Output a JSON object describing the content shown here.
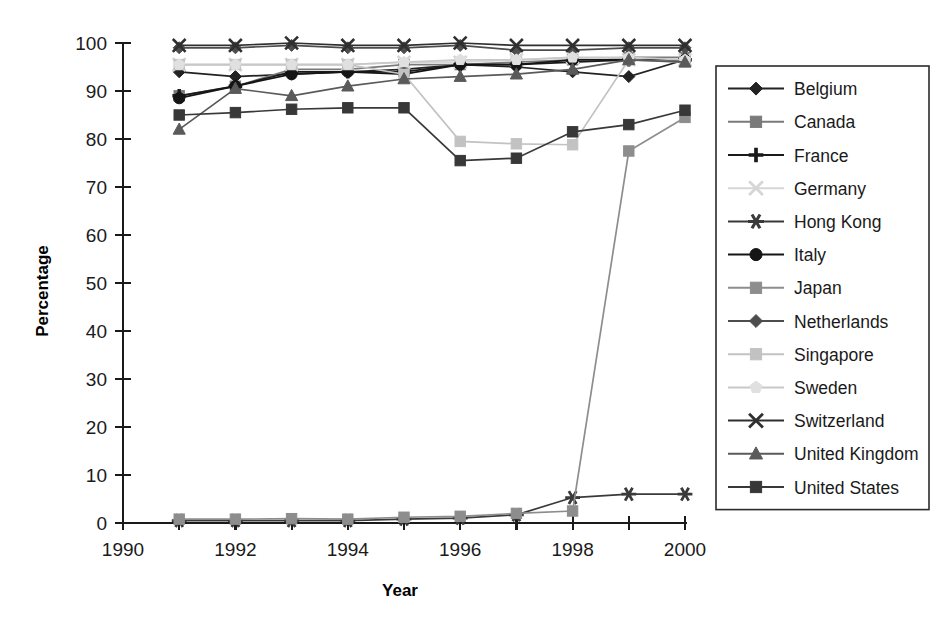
{
  "chart_data": {
    "type": "line",
    "title": "",
    "xlabel": "Year",
    "ylabel": "Percentage",
    "xlim": [
      1990,
      2000
    ],
    "ylim": [
      0,
      100
    ],
    "xticks": [
      1990,
      1991,
      1992,
      1993,
      1994,
      1995,
      1996,
      1997,
      1998,
      1999,
      2000
    ],
    "xtick_labels": [
      "1990",
      "",
      "1992",
      "",
      "1994",
      "",
      "1996",
      "",
      "1998",
      "",
      "2000"
    ],
    "yticks": [
      0,
      10,
      20,
      30,
      40,
      50,
      60,
      70,
      80,
      90,
      100
    ],
    "ytick_labels": [
      "0",
      "10",
      "20",
      "30",
      "40",
      "50",
      "60",
      "70",
      "80",
      "90",
      "100"
    ],
    "grid": false,
    "legend_position": "right",
    "x": [
      1991,
      1992,
      1993,
      1994,
      1995,
      1996,
      1997,
      1998,
      1999,
      2000
    ],
    "series": [
      {
        "name": "Belgium",
        "marker": "diamond",
        "color": "#222222",
        "line_color": "#222222",
        "values": [
          94.0,
          93.0,
          93.5,
          94.0,
          94.5,
          95.5,
          95.0,
          94.0,
          93.0,
          96.5
        ]
      },
      {
        "name": "Canada",
        "marker": "square",
        "color": "#7a7a7a",
        "line_color": "#7a7a7a",
        "values": [
          89.0,
          91.0,
          94.5,
          94.5,
          95.5,
          95.5,
          96.0,
          96.5,
          97.0,
          97.0
        ]
      },
      {
        "name": "France",
        "marker": "plus",
        "color": "#1a1a1a",
        "line_color": "#1a1a1a",
        "values": [
          89.0,
          91.0,
          94.0,
          94.0,
          94.0,
          95.5,
          95.5,
          96.0,
          96.5,
          96.5
        ]
      },
      {
        "name": "Germany",
        "marker": "x",
        "color": "#d6d6d6",
        "line_color": "#d6d6d6",
        "values": [
          95.5,
          95.5,
          95.5,
          95.5,
          96.0,
          96.0,
          96.5,
          97.0,
          96.5,
          96.5
        ]
      },
      {
        "name": "Hong Kong",
        "marker": "asterisk",
        "color": "#3a3a3a",
        "line_color": "#3a3a3a",
        "values": [
          0.5,
          0.5,
          0.5,
          0.5,
          0.8,
          1.0,
          1.7,
          5.3,
          6.0,
          6.0
        ]
      },
      {
        "name": "Italy",
        "marker": "circle",
        "color": "#151515",
        "line_color": "#151515",
        "values": [
          88.5,
          91.0,
          93.5,
          94.0,
          93.5,
          95.5,
          95.5,
          96.5,
          96.5,
          96.5
        ]
      },
      {
        "name": "Japan",
        "marker": "square",
        "color": "#8d8d8d",
        "line_color": "#8d8d8d",
        "values": [
          0.8,
          0.8,
          0.9,
          0.8,
          1.2,
          1.4,
          2.0,
          2.5,
          77.5,
          84.5
        ]
      },
      {
        "name": "Netherlands",
        "marker": "diamond",
        "color": "#4d4d4d",
        "line_color": "#4d4d4d",
        "values": [
          99.0,
          99.0,
          99.5,
          99.0,
          99.0,
          99.5,
          98.5,
          98.5,
          99.0,
          99.0
        ]
      },
      {
        "name": "Singapore",
        "marker": "square",
        "color": "#c2c2c2",
        "line_color": "#c2c2c2",
        "values": [
          95.5,
          95.5,
          95.5,
          95.5,
          93.5,
          79.5,
          79.0,
          78.8,
          96.5,
          96.0
        ]
      },
      {
        "name": "Sweden",
        "marker": "pentagon",
        "color": "#e0e0e0",
        "line_color": "#c8c8c8",
        "values": [
          95.5,
          95.5,
          95.5,
          95.5,
          96.0,
          96.5,
          96.5,
          97.0,
          97.0,
          96.5
        ]
      },
      {
        "name": "Switzerland",
        "marker": "x",
        "color": "#2f2f2f",
        "line_color": "#2f2f2f",
        "values": [
          99.5,
          99.5,
          100.0,
          99.5,
          99.5,
          100.0,
          99.5,
          99.5,
          99.5,
          99.5
        ]
      },
      {
        "name": "United Kingdom",
        "marker": "triangle",
        "color": "#5a5a5a",
        "line_color": "#5a5a5a",
        "values": [
          82.0,
          90.5,
          89.0,
          91.0,
          92.5,
          93.0,
          93.5,
          94.5,
          96.5,
          96.0
        ]
      },
      {
        "name": "United States",
        "marker": "square",
        "color": "#383838",
        "line_color": "#383838",
        "values": [
          85.0,
          85.5,
          86.2,
          86.5,
          86.5,
          75.5,
          76.0,
          81.5,
          83.0,
          86.0
        ]
      }
    ]
  },
  "legend": {
    "items": [
      "Belgium",
      "Canada",
      "France",
      "Germany",
      "Hong Kong",
      "Italy",
      "Japan",
      "Netherlands",
      "Singapore",
      "Sweden",
      "Switzerland",
      "United Kingdom",
      "United States"
    ]
  }
}
